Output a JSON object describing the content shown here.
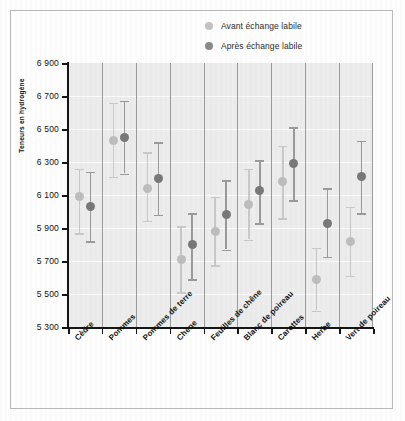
{
  "chart_data": {
    "type": "scatter",
    "title": "",
    "xlabel": "",
    "ylabel": "Teneurs en hydrogène",
    "ylim": [
      5300,
      6900
    ],
    "ytick_step": 200,
    "ytick_labels": [
      "6 900",
      "6 700",
      "6 500",
      "6 300",
      "6 100",
      "5 900",
      "5 700",
      "5 500",
      "5 300"
    ],
    "ytick_values": [
      6900,
      6700,
      6500,
      6300,
      6100,
      5900,
      5700,
      5500,
      5300
    ],
    "grid": "horizontal-and-vertical",
    "legend_position": "top-right",
    "categories": [
      "Cèdre",
      "Pommes",
      "Pommes de terre",
      "Chêne",
      "Feuilles de chêne",
      "Blanc de poireau",
      "Carottes",
      "Herbe",
      "Vert de poireau"
    ],
    "series": [
      {
        "name": "Avant échange labile",
        "color": "#bdbdbd",
        "values": [
          6090,
          6430,
          6140,
          5710,
          5880,
          6040,
          6180,
          5590,
          5820
        ],
        "err_low": [
          5870,
          6210,
          5945,
          5510,
          5675,
          5830,
          5960,
          5400,
          5610
        ],
        "err_high": [
          6260,
          6660,
          6360,
          5910,
          6090,
          6260,
          6400,
          5780,
          6030
        ]
      },
      {
        "name": "Après échange labile",
        "color": "#787878",
        "values": [
          6030,
          6450,
          6200,
          5800,
          5980,
          6130,
          6290,
          5930,
          6210
        ],
        "err_low": [
          5820,
          6230,
          5980,
          5590,
          5770,
          5930,
          6070,
          5725,
          5990
        ],
        "err_high": [
          6240,
          6670,
          6420,
          5990,
          6190,
          6310,
          6510,
          6140,
          6430
        ]
      }
    ]
  },
  "legend": {
    "items": [
      {
        "label": "Avant échange labile",
        "marker": "light-gray-dot"
      },
      {
        "label": "Après échange labile",
        "marker": "dark-gray-dot"
      }
    ]
  }
}
